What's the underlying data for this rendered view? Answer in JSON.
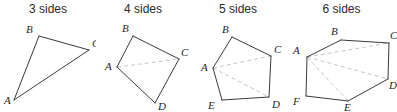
{
  "figure": {
    "width": 397,
    "height": 112,
    "background": "#ffffff",
    "edge_color": "#3a3a3a",
    "diagonal_color": "#c8c8c8",
    "label_color": "#1f1f1f",
    "title_color": "#2b2b2b"
  },
  "panels": [
    {
      "id": "panel-3-sides",
      "title": "3 sides",
      "shape": "triangle",
      "sides": 3,
      "origin": {
        "x": 0,
        "y": 0,
        "width": 96
      },
      "vertices": [
        {
          "name": "B",
          "x": 39,
          "y": 36,
          "label_x": 26,
          "label_y": 33
        },
        {
          "name": "C",
          "x": 89,
          "y": 50,
          "label_x": 92,
          "label_y": 47
        },
        {
          "name": "A",
          "x": 14,
          "y": 100,
          "label_x": 4,
          "label_y": 104
        }
      ],
      "edges": [
        [
          0,
          1
        ],
        [
          1,
          2
        ],
        [
          2,
          0
        ]
      ],
      "diagonals": []
    },
    {
      "id": "panel-4-sides",
      "title": "4 sides",
      "shape": "quadrilateral",
      "sides": 4,
      "origin": {
        "x": 96,
        "y": 0,
        "width": 94
      },
      "vertices": [
        {
          "name": "B",
          "x": 133,
          "y": 36,
          "label_x": 122,
          "label_y": 32
        },
        {
          "name": "C",
          "x": 179,
          "y": 59,
          "label_x": 181,
          "label_y": 56
        },
        {
          "name": "D",
          "x": 155,
          "y": 103,
          "label_x": 158,
          "label_y": 110
        },
        {
          "name": "A",
          "x": 117,
          "y": 67,
          "label_x": 105,
          "label_y": 70
        }
      ],
      "edges": [
        [
          0,
          1
        ],
        [
          1,
          2
        ],
        [
          2,
          3
        ],
        [
          3,
          0
        ]
      ],
      "diagonals": [
        [
          3,
          1
        ]
      ]
    },
    {
      "id": "panel-5-sides",
      "title": "5 sides",
      "shape": "pentagon",
      "sides": 5,
      "origin": {
        "x": 190,
        "y": 0,
        "width": 96
      },
      "vertices": [
        {
          "name": "B",
          "x": 232,
          "y": 37,
          "label_x": 222,
          "label_y": 33
        },
        {
          "name": "C",
          "x": 271,
          "y": 56,
          "label_x": 274,
          "label_y": 53
        },
        {
          "name": "D",
          "x": 269,
          "y": 97,
          "label_x": 272,
          "label_y": 108
        },
        {
          "name": "E",
          "x": 222,
          "y": 100,
          "label_x": 208,
          "label_y": 109
        },
        {
          "name": "A",
          "x": 213,
          "y": 68,
          "label_x": 201,
          "label_y": 71
        }
      ],
      "edges": [
        [
          0,
          1
        ],
        [
          1,
          2
        ],
        [
          2,
          3
        ],
        [
          3,
          4
        ],
        [
          4,
          0
        ]
      ],
      "diagonals": [
        [
          4,
          1
        ],
        [
          4,
          2
        ]
      ]
    },
    {
      "id": "panel-6-sides",
      "title": "6 sides",
      "shape": "hexagon",
      "sides": 6,
      "origin": {
        "x": 286,
        "y": 0,
        "width": 111
      },
      "vertices": [
        {
          "name": "B",
          "x": 341,
          "y": 40,
          "label_x": 331,
          "label_y": 35
        },
        {
          "name": "C",
          "x": 389,
          "y": 43,
          "label_x": 390,
          "label_y": 39
        },
        {
          "name": "D",
          "x": 388,
          "y": 79,
          "label_x": 389,
          "label_y": 89
        },
        {
          "name": "E",
          "x": 348,
          "y": 101,
          "label_x": 344,
          "label_y": 111
        },
        {
          "name": "F",
          "x": 306,
          "y": 96,
          "label_x": 293,
          "label_y": 105
        },
        {
          "name": "A",
          "x": 307,
          "y": 57,
          "label_x": 293,
          "label_y": 54
        }
      ],
      "edges": [
        [
          0,
          1
        ],
        [
          1,
          2
        ],
        [
          2,
          3
        ],
        [
          3,
          4
        ],
        [
          4,
          5
        ],
        [
          5,
          0
        ]
      ],
      "diagonals": [
        [
          5,
          1
        ],
        [
          5,
          2
        ],
        [
          5,
          3
        ]
      ]
    }
  ]
}
